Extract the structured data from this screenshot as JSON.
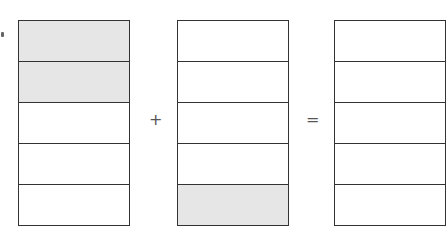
{
  "diagram": {
    "operator_plus": "+",
    "operator_equals": "=",
    "bars": [
      {
        "name": "first-fraction",
        "cells": [
          true,
          true,
          false,
          false,
          false
        ]
      },
      {
        "name": "second-fraction",
        "cells": [
          false,
          false,
          false,
          false,
          true
        ]
      },
      {
        "name": "result-fraction",
        "cells": [
          false,
          false,
          false,
          false,
          false
        ]
      }
    ],
    "colors": {
      "shaded": "#e6e6e6",
      "border": "#333333"
    }
  }
}
